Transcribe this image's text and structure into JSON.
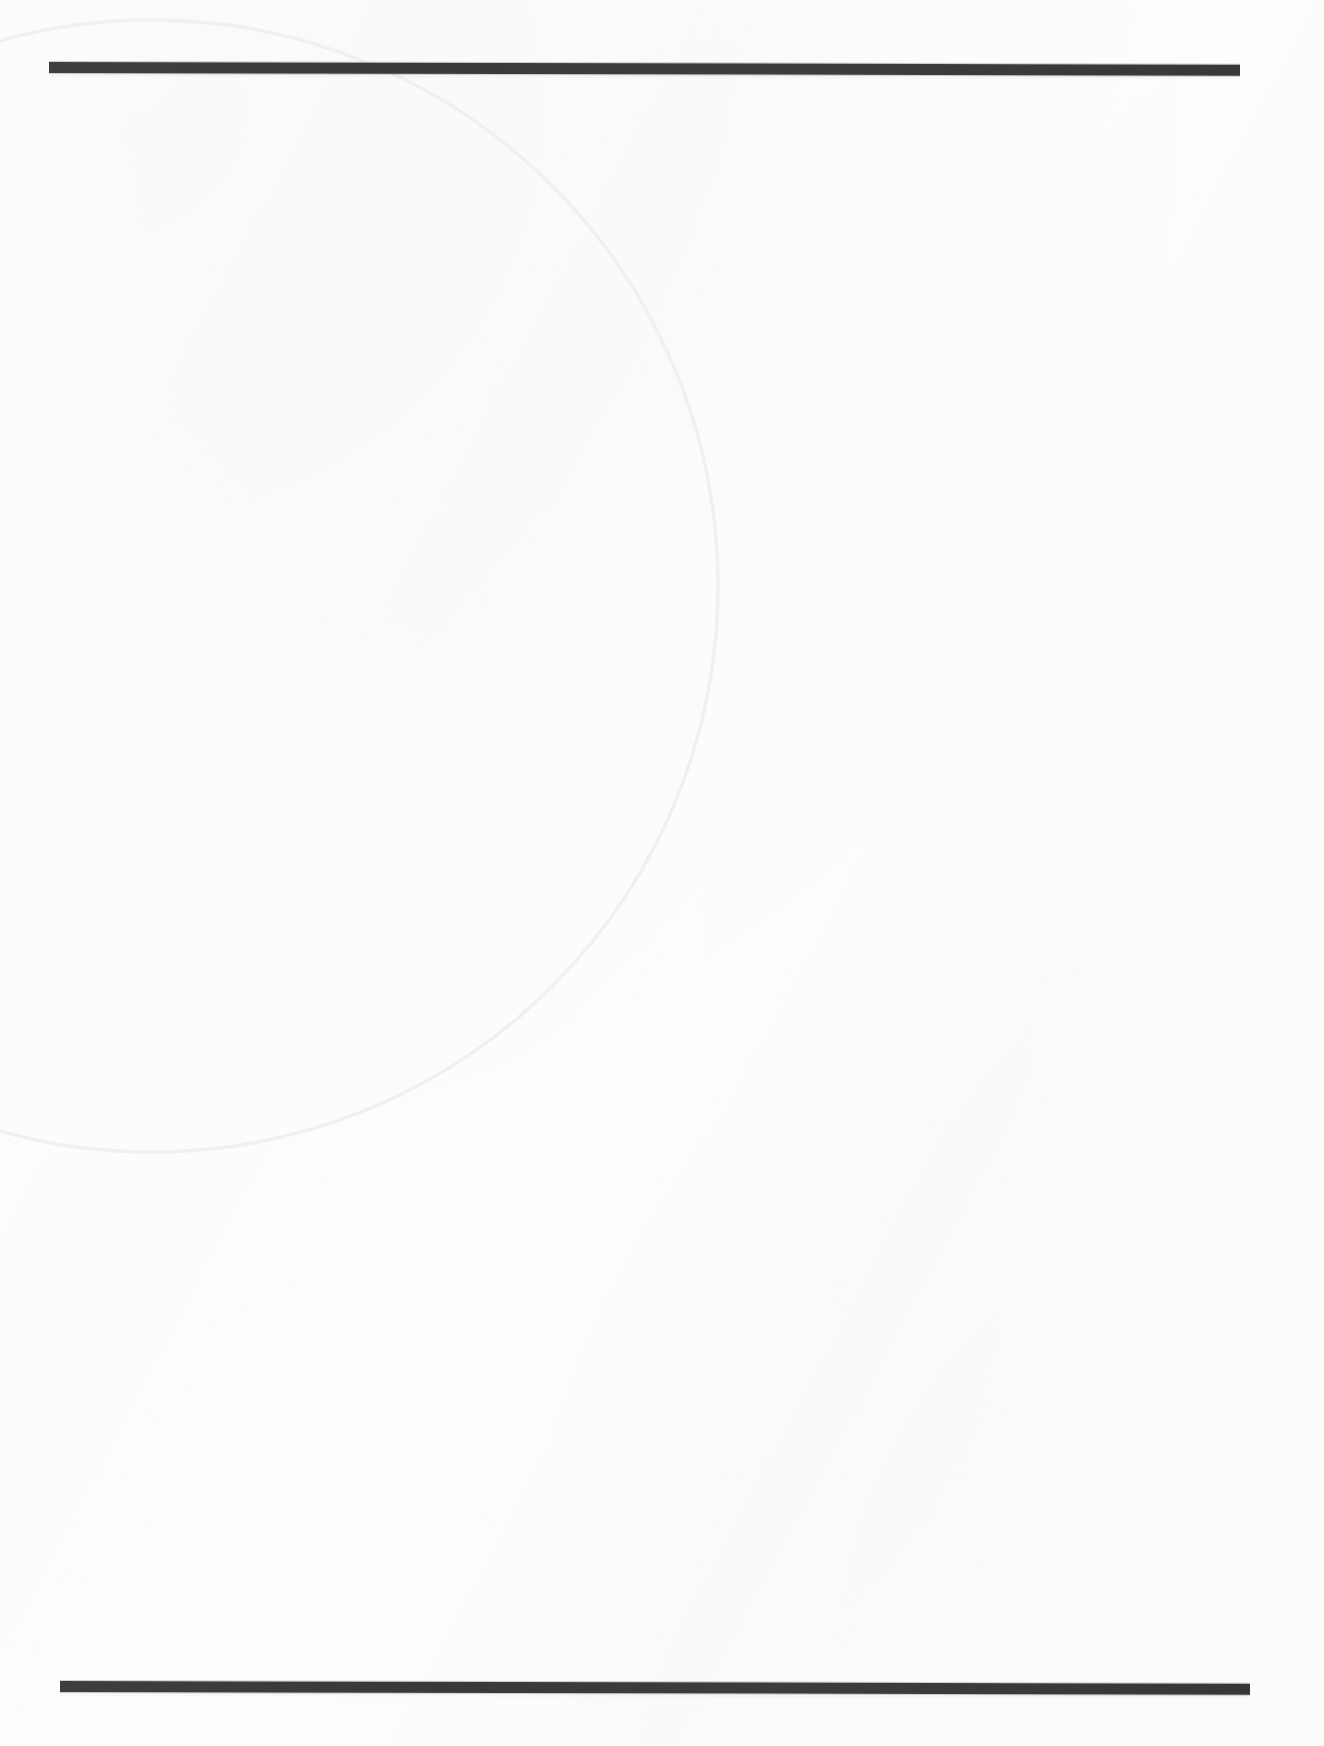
{
  "document": {
    "kind": "scanned-page",
    "page_width": 1324,
    "page_height": 1746,
    "background_color": "#ffffff",
    "text_content": "",
    "body_text_note": "",
    "visible_text": []
  },
  "rules": {
    "ink_color": "#3b3b3b",
    "top": {
      "name": "top-horizontal-rule",
      "x": 49,
      "y": 62,
      "width": 1191,
      "height": 11,
      "rotation_deg": 0.13
    },
    "bottom": {
      "name": "bottom-horizontal-rule",
      "x": 60,
      "y": 1681,
      "width": 1190,
      "height": 11,
      "rotation_deg": 0.13
    }
  },
  "arc": {
    "name": "faint-circular-impression",
    "stroke_color": "#e3e3e6",
    "stroke_width": 1.6,
    "center_x": 152,
    "center_y": 586,
    "radius": 566,
    "description": "large faint circle arc crossing the upper rule near x=410 and exiting the left edge near y=55 and y=1030"
  },
  "palette": {
    "paper": "#ffffff",
    "paper_shade": "#fcfcfc",
    "rule_ink": "#3b3b3b",
    "arc_line": "#e3e3e6"
  }
}
